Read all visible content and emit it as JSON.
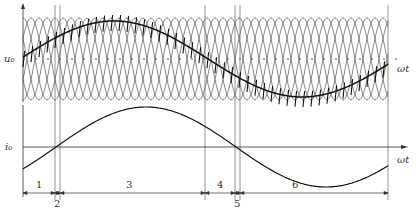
{
  "figure": {
    "upper_plot": {
      "y_label": "u₀",
      "x_label": "ωt",
      "description": "Cycloconverter output voltage formed from overlapping phase voltage segments"
    },
    "lower_plot": {
      "y_label": "i₀",
      "x_label": "ωt",
      "description": "Load current (sinusoidal) with ripple"
    },
    "intervals": [
      {
        "label": "1",
        "x_start": 23,
        "x_end": 55
      },
      {
        "label": "2",
        "x_start": 55,
        "x_end": 60
      },
      {
        "label": "3",
        "x_start": 60,
        "x_end": 205
      },
      {
        "label": "4",
        "x_start": 205,
        "x_end": 235
      },
      {
        "label": "5",
        "x_start": 235,
        "x_end": 240
      },
      {
        "label": "6",
        "x_start": 240,
        "x_end": 388
      }
    ],
    "colors": {
      "line": "#222222",
      "thin": "#555555",
      "background": "#ffffff"
    }
  }
}
